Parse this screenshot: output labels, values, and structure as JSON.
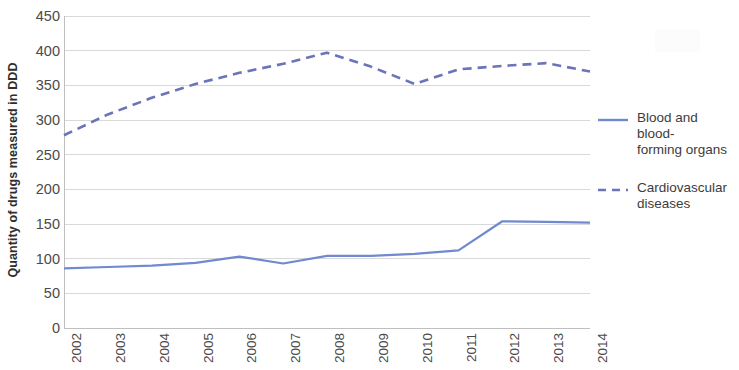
{
  "chart_data": {
    "type": "line",
    "title": "",
    "xlabel": "",
    "ylabel": "Quantity of drugs measured in DDD",
    "x": [
      2002,
      2003,
      2004,
      2005,
      2006,
      2007,
      2008,
      2009,
      2010,
      2011,
      2012,
      2013,
      2014
    ],
    "categories": [
      "2002",
      "2003",
      "2004",
      "2005",
      "2006",
      "2007",
      "2008",
      "2009",
      "2010",
      "2011",
      "2012",
      "2013",
      "2014"
    ],
    "ylim": [
      0,
      450
    ],
    "yticks": [
      0,
      50,
      100,
      150,
      200,
      250,
      300,
      350,
      400,
      450
    ],
    "ytick_labels": [
      "0",
      "50",
      "100",
      "150",
      "200",
      "250",
      "300",
      "350",
      "400",
      "450"
    ],
    "grid": true,
    "grid_axis": "y",
    "legend_position": "right",
    "series": [
      {
        "name": "Blood and blood-forming organs",
        "style": "solid",
        "color": "#7089d0",
        "values": [
          86,
          88,
          90,
          94,
          103,
          93,
          104,
          104,
          107,
          112,
          154,
          153,
          152
        ]
      },
      {
        "name": "Cardiovascular diseases",
        "style": "dashed",
        "color": "#6a74b8",
        "values": [
          278,
          308,
          332,
          352,
          368,
          381,
          397,
          377,
          352,
          373,
          378,
          382,
          370
        ]
      }
    ]
  },
  "legend": {
    "entries": [
      {
        "label_line1": "Blood and blood-",
        "label_line2": "forming organs"
      },
      {
        "label_line1": "Cardiovascular",
        "label_line2": "diseases"
      }
    ]
  },
  "axes": {
    "y_title": "Quantity of drugs measured in DDD"
  },
  "colors": {
    "series_solid": "#7089d0",
    "series_dashed": "#6a74b8",
    "gridline": "#d9d9d9",
    "axis": "#bfbfbf",
    "tick_text": "#4a4a4a"
  }
}
